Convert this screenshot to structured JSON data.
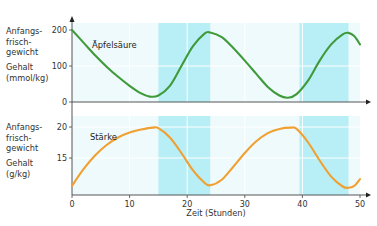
{
  "chart_data": [
    {
      "type": "line",
      "panel": "top",
      "title": "",
      "series_label": "Äpfelsäure",
      "ylabel_lines": [
        "Anfangs-",
        "frisch-",
        "gewicht"
      ],
      "ylabel_unit_lines": [
        "Gehalt",
        "(mmol/kg)"
      ],
      "xlabel": "",
      "xlim": [
        0,
        50
      ],
      "ylim": [
        0,
        215
      ],
      "yticks": [
        0,
        100,
        200
      ],
      "ytick_labels": [
        "0",
        "100",
        "200"
      ],
      "grid": true,
      "color": "#3f9a3a",
      "dark_periods": [
        [
          15,
          24
        ],
        [
          39.5,
          48
        ]
      ],
      "series": [
        {
          "name": "Äpfelsäure",
          "x": [
            0,
            2,
            4,
            6,
            8,
            10,
            12,
            13.5,
            15,
            17,
            19,
            21,
            23,
            24,
            26,
            28,
            30,
            32,
            34,
            36,
            37.5,
            39,
            41,
            43,
            45,
            47,
            48,
            49,
            50
          ],
          "y": [
            200,
            165,
            130,
            98,
            70,
            45,
            24,
            15,
            18,
            45,
            100,
            155,
            190,
            193,
            180,
            150,
            115,
            78,
            42,
            18,
            12,
            22,
            60,
            115,
            160,
            188,
            192,
            183,
            160
          ]
        }
      ]
    },
    {
      "type": "line",
      "panel": "bottom",
      "title": "",
      "series_label": "Stärke",
      "ylabel_lines": [
        "Anfangs-",
        "frisch-",
        "gewicht"
      ],
      "ylabel_unit_lines": [
        "Gehalt",
        "(g/kg)"
      ],
      "xlabel": "Zeit (Stunden)",
      "xlim": [
        0,
        50
      ],
      "ylim": [
        9,
        21.5
      ],
      "xticks": [
        0,
        10,
        20,
        30,
        40,
        50
      ],
      "xtick_labels": [
        "0",
        "10",
        "20",
        "30",
        "40",
        "50"
      ],
      "yticks": [
        15,
        20
      ],
      "ytick_labels": [
        "15",
        "20"
      ],
      "grid": true,
      "color": "#f0a030",
      "dark_periods": [
        [
          15,
          24
        ],
        [
          39.5,
          48
        ]
      ],
      "series": [
        {
          "name": "Stärke",
          "x": [
            0,
            2,
            4,
            6,
            8,
            10,
            12,
            14,
            15,
            17,
            19,
            21,
            23,
            24,
            26,
            28,
            30,
            32,
            34,
            36,
            38,
            39,
            41,
            43,
            45,
            47,
            48,
            49,
            50
          ],
          "y": [
            10.5,
            13.2,
            15.4,
            17.1,
            18.3,
            19.1,
            19.6,
            19.9,
            19.8,
            18.3,
            15.8,
            13.0,
            11.0,
            10.6,
            11.5,
            13.6,
            15.8,
            17.7,
            19.0,
            19.7,
            19.9,
            19.7,
            17.5,
            14.6,
            12.0,
            10.4,
            10.2,
            10.5,
            11.6
          ]
        }
      ]
    }
  ]
}
